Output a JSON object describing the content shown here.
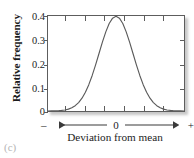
{
  "figure": {
    "caption": "(c)"
  },
  "axes": {
    "ylabel": "Relative frequency",
    "xlabel": "Deviation from mean",
    "y_tick_labels": [
      "0.4",
      "0.3",
      "0.2",
      "0.1",
      "0"
    ],
    "deviation_axis": {
      "left_sign": "–",
      "center": "0",
      "right_sign": "+"
    }
  },
  "style": {
    "curve_color": "#5a5a5a",
    "frame_color": "#5d5d5d",
    "text_color": "#1c1c1c",
    "background": "#ffffff"
  },
  "chart_data": {
    "type": "line",
    "title": "",
    "subtitle": "",
    "xlabel": "Deviation from mean",
    "ylabel": "Relative frequency",
    "xlim": [
      -4,
      4
    ],
    "ylim": [
      0,
      0.4
    ],
    "ytick_values": [
      0,
      0.1,
      0.2,
      0.3,
      0.4
    ],
    "ytick_labels": [
      "0",
      "0.1",
      "0.2",
      "0.3",
      "0.4"
    ],
    "xtick_values": [
      -3,
      -2,
      -1,
      0,
      1,
      2,
      3
    ],
    "xtick_labels": [
      "",
      "",
      "",
      "0",
      "",
      "",
      ""
    ],
    "grid": false,
    "legend": null,
    "annotations": [
      "(c)"
    ],
    "series": [
      {
        "name": "Normal distribution",
        "x": [
          -4.0,
          -3.8,
          -3.6,
          -3.4,
          -3.2,
          -3.0,
          -2.8,
          -2.6,
          -2.4,
          -2.2,
          -2.0,
          -1.8,
          -1.6,
          -1.4,
          -1.2,
          -1.0,
          -0.8,
          -0.6,
          -0.4,
          -0.2,
          0.0,
          0.2,
          0.4,
          0.6,
          0.8,
          1.0,
          1.2,
          1.4,
          1.6,
          1.8,
          2.0,
          2.2,
          2.4,
          2.6,
          2.8,
          3.0,
          3.2,
          3.4,
          3.6,
          3.8,
          4.0
        ],
        "y": [
          0.0001,
          0.0003,
          0.0006,
          0.0012,
          0.0024,
          0.0044,
          0.0079,
          0.0136,
          0.0224,
          0.0355,
          0.054,
          0.079,
          0.1109,
          0.1497,
          0.1942,
          0.242,
          0.2897,
          0.3332,
          0.3683,
          0.391,
          0.3989,
          0.391,
          0.3683,
          0.3332,
          0.2897,
          0.242,
          0.1942,
          0.1497,
          0.1109,
          0.079,
          0.054,
          0.0355,
          0.0224,
          0.0136,
          0.0079,
          0.0044,
          0.0024,
          0.0012,
          0.0006,
          0.0003,
          0.0001
        ]
      }
    ]
  }
}
